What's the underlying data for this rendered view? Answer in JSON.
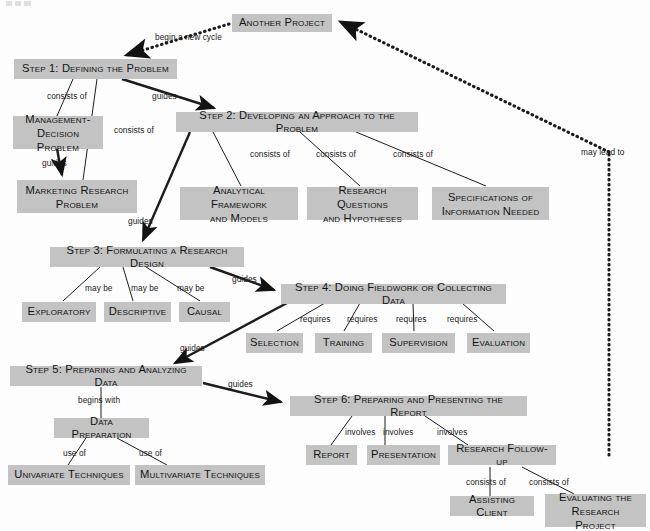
{
  "diagram": {
    "box_fill": "#c3c3c3",
    "text_color": "#121212",
    "background": "#fdfdfd",
    "nodes": [
      {
        "id": "another_project",
        "label": "Another Project"
      },
      {
        "id": "step1",
        "label": "Step 1: Defining the Problem"
      },
      {
        "id": "mgmt_decision",
        "label": "Management-\nDecision Problem"
      },
      {
        "id": "marketing_research",
        "label": "Marketing Research\nProblem"
      },
      {
        "id": "step2",
        "label": "Step 2: Developing an Approach to the Problem"
      },
      {
        "id": "analytical_framework",
        "label": "Analytical Framework\nand Models"
      },
      {
        "id": "research_questions",
        "label": "Research Questions\nand Hypotheses"
      },
      {
        "id": "specifications",
        "label": "Specifications of\nInformation Needed"
      },
      {
        "id": "step3",
        "label": "Step 3: Formulating a Research Design"
      },
      {
        "id": "exploratory",
        "label": "Exploratory"
      },
      {
        "id": "descriptive",
        "label": "Descriptive"
      },
      {
        "id": "causal",
        "label": "Causal"
      },
      {
        "id": "step4",
        "label": "Step 4: Doing Fieldwork or Collecting Data"
      },
      {
        "id": "selection",
        "label": "Selection"
      },
      {
        "id": "training",
        "label": "Training"
      },
      {
        "id": "supervision",
        "label": "Supervision"
      },
      {
        "id": "evaluation",
        "label": "Evaluation"
      },
      {
        "id": "step5",
        "label": "Step 5: Preparing and Analyzing Data"
      },
      {
        "id": "data_preparation",
        "label": "Data Preparation"
      },
      {
        "id": "univariate",
        "label": "Univariate Techniques"
      },
      {
        "id": "multivariate",
        "label": "Multivariate Techniques"
      },
      {
        "id": "step6",
        "label": "Step 6: Preparing and Presenting the Report"
      },
      {
        "id": "report",
        "label": "Report"
      },
      {
        "id": "presentation",
        "label": "Presentation"
      },
      {
        "id": "research_followup",
        "label": "Research Follow-up"
      },
      {
        "id": "assisting_client",
        "label": "Assisting Client"
      },
      {
        "id": "evaluating_project",
        "label": "Evaluating the\nResearch Project"
      }
    ],
    "edge_labels": [
      {
        "id": "begin_new_cycle",
        "text": "begin a new cycle"
      },
      {
        "id": "s1_consists_of_a",
        "text": "consists of"
      },
      {
        "id": "s1_consists_of_b",
        "text": "consists of"
      },
      {
        "id": "s1_guides",
        "text": "guides"
      },
      {
        "id": "mgmt_guides",
        "text": "guides"
      },
      {
        "id": "s2_consists_of_a",
        "text": "consists of"
      },
      {
        "id": "s2_consists_of_b",
        "text": "consists of"
      },
      {
        "id": "s2_consists_of_c",
        "text": "consists of"
      },
      {
        "id": "s2_guides",
        "text": "guides"
      },
      {
        "id": "s3_may_be_a",
        "text": "may be"
      },
      {
        "id": "s3_may_be_b",
        "text": "may be"
      },
      {
        "id": "s3_may_be_c",
        "text": "may be"
      },
      {
        "id": "s3_guides",
        "text": "guides"
      },
      {
        "id": "s4_requires_a",
        "text": "requires"
      },
      {
        "id": "s4_requires_b",
        "text": "requires"
      },
      {
        "id": "s4_requires_c",
        "text": "requires"
      },
      {
        "id": "s4_requires_d",
        "text": "requires"
      },
      {
        "id": "s4_guides",
        "text": "guides"
      },
      {
        "id": "s5_begins_with",
        "text": "begins with"
      },
      {
        "id": "s5_guides",
        "text": "guides"
      },
      {
        "id": "dp_use_of_a",
        "text": "use of"
      },
      {
        "id": "dp_use_of_b",
        "text": "use of"
      },
      {
        "id": "s6_involves_a",
        "text": "involves"
      },
      {
        "id": "s6_involves_b",
        "text": "involves"
      },
      {
        "id": "s6_involves_c",
        "text": "involves"
      },
      {
        "id": "rf_consists_of_a",
        "text": "consists of"
      },
      {
        "id": "rf_consists_of_b",
        "text": "consists of"
      },
      {
        "id": "may_lead_to",
        "text": "may lead to"
      }
    ]
  }
}
